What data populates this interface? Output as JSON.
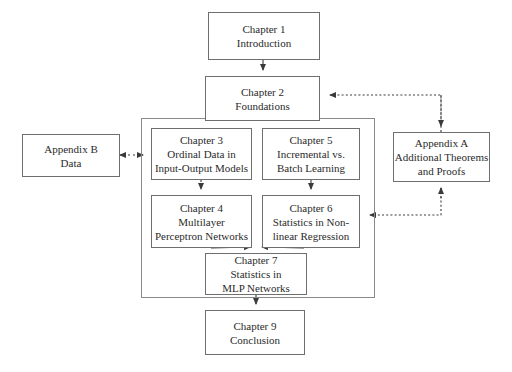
{
  "diagram": {
    "type": "flowchart",
    "background_color": "#ffffff",
    "line_color": "#4a4a4a",
    "box_border_color": "#6f6f6f",
    "text_color": "#2b2b2b",
    "nodes": [
      {
        "id": "chapter1",
        "lines": [
          "Chapter 1",
          "Introduction"
        ],
        "x": 208,
        "y": 12,
        "w": 112,
        "h": 48
      },
      {
        "id": "chapter2",
        "lines": [
          "Chapter 2",
          "Foundations"
        ],
        "x": 205,
        "y": 76,
        "w": 115,
        "h": 45
      },
      {
        "id": "chapter3",
        "lines": [
          "Chapter 3",
          "Ordinal Data in",
          "Input-Output Models"
        ],
        "x": 151,
        "y": 128,
        "w": 101,
        "h": 52
      },
      {
        "id": "chapter4",
        "lines": [
          "Chapter 4",
          "Multilayer",
          "Perceptron Networks"
        ],
        "x": 151,
        "y": 195,
        "w": 101,
        "h": 53
      },
      {
        "id": "chapter5",
        "lines": [
          "Chapter 5",
          "Incremental vs.",
          "Batch Learning"
        ],
        "x": 262,
        "y": 128,
        "w": 98,
        "h": 52
      },
      {
        "id": "chapter6",
        "lines": [
          "Chapter 6",
          "Statistics in Non-",
          "linear Regression"
        ],
        "x": 262,
        "y": 195,
        "w": 98,
        "h": 53
      },
      {
        "id": "chapter7",
        "lines": [
          "Chapter 7",
          "Statistics in",
          "MLP Networks"
        ],
        "x": 205,
        "y": 253,
        "w": 102,
        "h": 42
      },
      {
        "id": "chapter9",
        "lines": [
          "Chapter 9",
          "Conclusion"
        ],
        "x": 205,
        "y": 310,
        "w": 100,
        "h": 45
      },
      {
        "id": "appendixA",
        "lines": [
          "Appendix A",
          "Additional Theorems",
          "and Proofs"
        ],
        "x": 393,
        "y": 132,
        "w": 97,
        "h": 50
      },
      {
        "id": "appendixB",
        "lines": [
          "Appendix B",
          "Data"
        ],
        "x": 22,
        "y": 134,
        "w": 98,
        "h": 43
      }
    ],
    "group_box": {
      "id": "core-chapters-group",
      "x": 141,
      "y": 118,
      "w": 234,
      "h": 180
    },
    "edges": [
      {
        "id": "ch1-to-ch2",
        "style": "solid",
        "from": "chapter1",
        "to": "chapter2"
      },
      {
        "id": "ch2-to-group",
        "style": "solid",
        "from": "chapter2",
        "to": "core-chapters-group"
      },
      {
        "id": "ch3-to-ch4",
        "style": "dotted",
        "from": "chapter3",
        "to": "chapter4"
      },
      {
        "id": "ch5-to-ch6",
        "style": "solid",
        "from": "chapter5",
        "to": "chapter6"
      },
      {
        "id": "ch4-to-ch7",
        "style": "solid",
        "from": "chapter4",
        "to": "chapter7"
      },
      {
        "id": "ch6-to-ch7",
        "style": "solid",
        "from": "chapter6",
        "to": "chapter7"
      },
      {
        "id": "ch7-to-ch9",
        "style": "solid",
        "from": "chapter7",
        "to": "chapter9"
      },
      {
        "id": "appendixB-link",
        "style": "dotted",
        "from": "appendixB",
        "to": "chapter3",
        "bidirectional": true
      },
      {
        "id": "appendixA-to-ch2",
        "style": "dotted",
        "from": "appendixA",
        "to": "chapter2"
      },
      {
        "id": "ch6-to-appendixA",
        "style": "dotted",
        "from": "chapter6",
        "to": "appendixA"
      }
    ]
  }
}
